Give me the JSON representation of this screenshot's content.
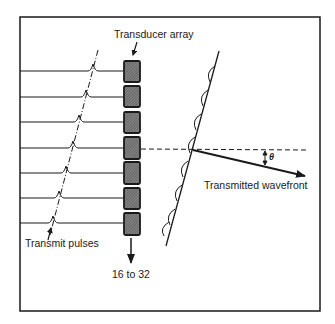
{
  "diagram": {
    "labels": {
      "transducer_array": "Transducer array",
      "transmit_pulses": "Transmit pulses",
      "element_count": "16 to 32",
      "transmitted_wavefront": "Transmitted wavefront",
      "angle": "θ"
    },
    "elements": {
      "count_shown": 7,
      "rows_y": [
        71,
        97,
        122,
        148,
        173,
        198,
        223
      ],
      "pulse_x": [
        93,
        86,
        79,
        73,
        66,
        59,
        53
      ]
    },
    "colors": {
      "ink": "#1a1a1a",
      "element_fill": "#555555",
      "background": "#ffffff"
    }
  }
}
